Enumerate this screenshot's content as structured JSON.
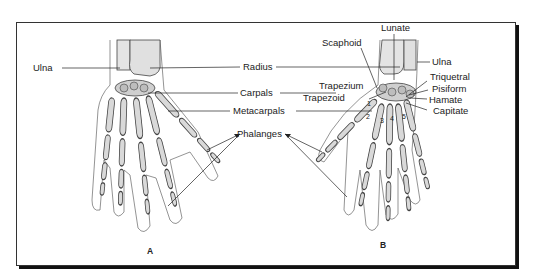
{
  "figure": {
    "panel_a": {
      "caption": "A",
      "labels": {
        "ulna": "Ulna"
      }
    },
    "shared_labels": {
      "radius": "Radius",
      "carpals": "Carpals",
      "metacarpals": "Metacarpals",
      "phalanges": "Phalanges"
    },
    "panel_b": {
      "caption": "B",
      "labels": {
        "lunate": "Lunate",
        "scaphoid": "Scaphoid",
        "ulna": "Ulna",
        "trapezium": "Trapezium",
        "trapezoid": "Trapezoid",
        "triquetral": "Triquetral",
        "pisiform": "Pisiform",
        "hamate": "Hamate",
        "capitate": "Capitate"
      },
      "metacarpal_numbers": [
        "1",
        "2",
        "3",
        "4",
        "5"
      ]
    },
    "colors": {
      "bone_fill": "#d9d9d9",
      "bone_stroke": "#444444",
      "line": "#222222",
      "frame_shadow": "#111111"
    }
  }
}
